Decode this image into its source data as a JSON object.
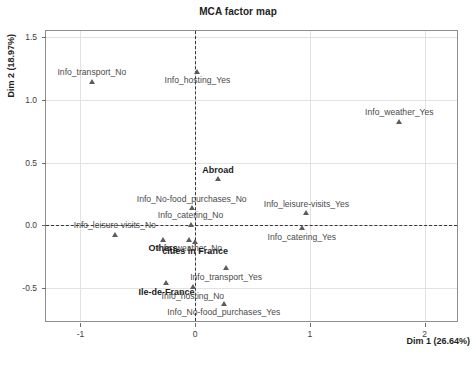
{
  "chart_data": {
    "type": "scatter",
    "title": "MCA factor map",
    "xlabel": "Dim 1 (26.64%)",
    "ylabel": "Dim 2 (18.97%)",
    "xlim": [
      -1.3,
      2.3
    ],
    "ylim": [
      -0.78,
      1.55
    ],
    "xticks": [
      "-1",
      "0",
      "1",
      "2"
    ],
    "xtick_values": [
      -1,
      0,
      1,
      2
    ],
    "yticks": [
      "1.5",
      "1.0",
      "0.5",
      "0.0",
      "-0.5"
    ],
    "ytick_values": [
      1.5,
      1.0,
      0.5,
      0.0,
      -0.5
    ],
    "grid": true,
    "legend": "none",
    "reference_lines": {
      "vertical_x": 0,
      "horizontal_y": 0,
      "style": "dashed"
    },
    "marker": "triangle",
    "points": [
      {
        "label": "Info_transport_No",
        "x": -0.9,
        "y": 1.15,
        "label_pos": "above",
        "emphasis": "normal"
      },
      {
        "label": "Info_hosting_Yes",
        "x": 0.02,
        "y": 1.23,
        "label_pos": "below",
        "emphasis": "normal"
      },
      {
        "label": "Info_weather_Yes",
        "x": 1.78,
        "y": 0.83,
        "label_pos": "above",
        "emphasis": "normal"
      },
      {
        "label": "Abroad",
        "x": 0.2,
        "y": 0.37,
        "label_pos": "above",
        "emphasis": "bold"
      },
      {
        "label": "Info_No-food_purchases_No",
        "x": -0.03,
        "y": 0.14,
        "label_pos": "above",
        "emphasis": "normal"
      },
      {
        "label": "Info_leisure-visits_Yes",
        "x": 0.97,
        "y": 0.1,
        "label_pos": "above",
        "emphasis": "normal"
      },
      {
        "label": "Info_catering_No",
        "x": -0.04,
        "y": 0.01,
        "label_pos": "above",
        "emphasis": "normal"
      },
      {
        "label": "Info_leisure-visits_No",
        "x": -0.7,
        "y": -0.07,
        "label_pos": "above",
        "emphasis": "normal"
      },
      {
        "label": "Info_catering_Yes",
        "x": 0.93,
        "y": -0.02,
        "label_pos": "below",
        "emphasis": "normal"
      },
      {
        "label": "Others",
        "x": -0.28,
        "y": -0.11,
        "label_pos": "below",
        "emphasis": "bold"
      },
      {
        "label": "Info_weather_No",
        "x": -0.05,
        "y": -0.11,
        "label_pos": "below",
        "emphasis": "normal"
      },
      {
        "label": "cities in France",
        "x": 0.0,
        "y": -0.13,
        "label_pos": "below",
        "emphasis": "bold"
      },
      {
        "label": "Info_transport_Yes",
        "x": 0.27,
        "y": -0.34,
        "label_pos": "below",
        "emphasis": "normal"
      },
      {
        "label": "Ile-de-France",
        "x": -0.25,
        "y": -0.46,
        "label_pos": "below",
        "emphasis": "bold"
      },
      {
        "label": "Info_hosting_No",
        "x": -0.02,
        "y": -0.49,
        "label_pos": "below",
        "emphasis": "normal"
      },
      {
        "label": "Info_No-food_purchases_Yes",
        "x": 0.25,
        "y": -0.62,
        "label_pos": "below",
        "emphasis": "normal"
      }
    ]
  },
  "colors": {
    "frame": "#8e8e8e",
    "grid": "#e2e2e2",
    "reference_line": "#353535",
    "marker": "#5c5c5c",
    "label_text": "#4a4a4a",
    "background": "#ffffff"
  }
}
